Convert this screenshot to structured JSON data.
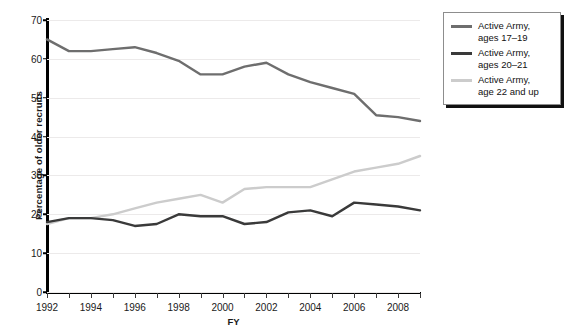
{
  "chart_data": {
    "type": "line",
    "title": "",
    "xlabel": "FY",
    "ylabel": "Percentage of older recruits",
    "xlim": [
      1992,
      2009
    ],
    "ylim": [
      0,
      70
    ],
    "ytick_values": [
      0,
      10,
      20,
      30,
      40,
      50,
      60,
      70
    ],
    "ytick_labels": [
      "0",
      "10",
      "20",
      "30",
      "40",
      "50",
      "60",
      "70"
    ],
    "xtick_values": [
      1992,
      1993,
      1994,
      1995,
      1996,
      1997,
      1998,
      1999,
      2000,
      2001,
      2002,
      2003,
      2004,
      2005,
      2006,
      2007,
      2008,
      2009
    ],
    "xtick_labels": [
      "1992",
      "",
      "1994",
      "",
      "1996",
      "",
      "1998",
      "",
      "2000",
      "",
      "2002",
      "",
      "2004",
      "",
      "2006",
      "",
      "2008",
      ""
    ],
    "grid": true,
    "grid_axis": "y",
    "legend_position": "upper-right-outside",
    "x": [
      1992,
      1993,
      1994,
      1995,
      1996,
      1997,
      1998,
      1999,
      2000,
      2001,
      2002,
      2003,
      2004,
      2005,
      2006,
      2007,
      2008,
      2009
    ],
    "series": [
      {
        "name": "Active Army, ages 17–19",
        "label_line1": "Active Army,",
        "label_line2": "ages 17–19",
        "color": "#6e6e6e",
        "values": [
          65,
          62,
          62,
          62.5,
          63,
          61.5,
          59.5,
          56,
          56,
          58,
          59,
          56,
          54,
          52.5,
          51,
          45.5,
          45,
          44
        ]
      },
      {
        "name": "Active Army, ages 20–21",
        "label_line1": "Active Army,",
        "label_line2": "ages 20–21",
        "color": "#3a3a3a",
        "values": [
          18,
          19,
          19,
          18.5,
          17,
          17.5,
          20,
          19.5,
          19.5,
          17.5,
          18,
          20.5,
          21,
          19.5,
          23,
          22.5,
          22,
          21
        ]
      },
      {
        "name": "Active Army, age 22 and up",
        "label_line1": "Active Army,",
        "label_line2": "age 22 and up",
        "color": "#cccccc",
        "values": [
          17.5,
          19,
          19,
          20,
          21.5,
          23,
          24,
          25,
          23,
          26.5,
          27,
          27,
          27,
          29,
          31,
          32,
          33,
          35
        ]
      }
    ]
  },
  "legend": {
    "items": [
      {
        "line1": "Active Army,",
        "line2": "ages 17–19"
      },
      {
        "line1": "Active Army,",
        "line2": "ages 20–21"
      },
      {
        "line1": "Active Army,",
        "line2": "age 22 and up"
      }
    ]
  }
}
